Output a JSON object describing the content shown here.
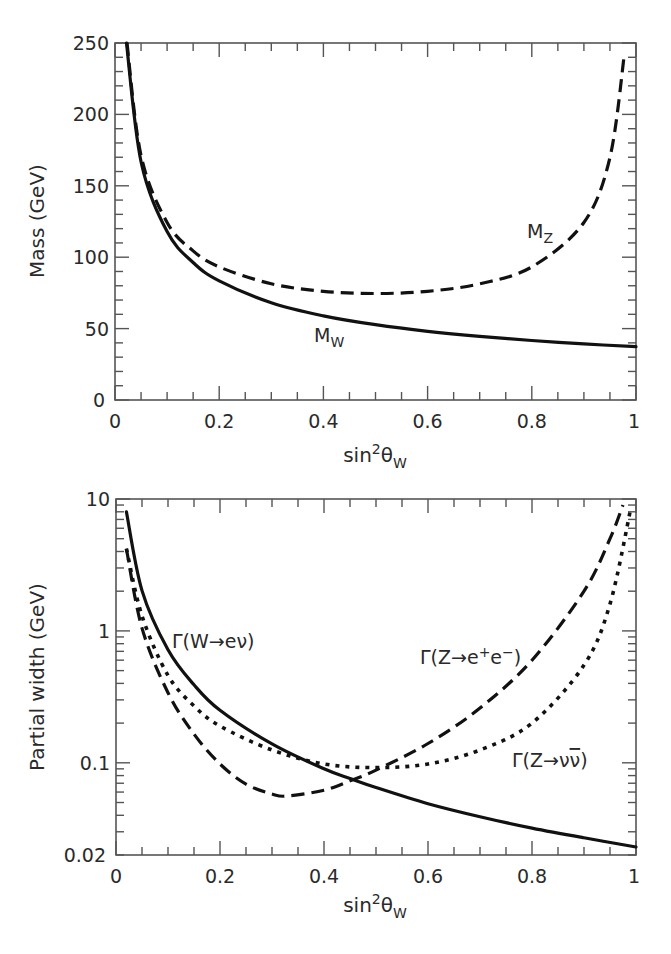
{
  "chart_data": [
    {
      "type": "line",
      "panel": "top",
      "xlabel": "sin²θ_W",
      "xlabel_parts": {
        "base": "sin",
        "sup": "2",
        "theta": "θ",
        "sub": "W"
      },
      "ylabel": "Mass (GeV)",
      "xlim": [
        0,
        1
      ],
      "ylim": [
        0,
        250
      ],
      "x_ticks": [
        "0",
        "0.2",
        "0.4",
        "0.6",
        "0.8",
        "1"
      ],
      "y_ticks": [
        "0",
        "50",
        "100",
        "150",
        "200",
        "250"
      ],
      "grid": false,
      "series": [
        {
          "name": "M_W",
          "label_base": "M",
          "label_sub": "W",
          "style": "solid",
          "x": [
            0.022,
            0.05,
            0.1,
            0.15,
            0.2,
            0.3,
            0.4,
            0.5,
            0.6,
            0.7,
            0.8,
            0.9,
            1.0
          ],
          "y": [
            250,
            166.7,
            117.9,
            96.3,
            83.4,
            68.1,
            58.9,
            52.7,
            48.1,
            44.6,
            41.7,
            39.3,
            37.3
          ]
        },
        {
          "name": "M_Z",
          "label_base": "M",
          "label_sub": "Z",
          "style": "dashed",
          "x": [
            0.023,
            0.05,
            0.1,
            0.15,
            0.2,
            0.3,
            0.4,
            0.5,
            0.6,
            0.7,
            0.8,
            0.9,
            0.95,
            0.978
          ],
          "y": [
            250,
            171,
            124.3,
            104.4,
            93.2,
            81.4,
            76.1,
            74.6,
            76.1,
            81.4,
            93.2,
            124.3,
            170,
            243
          ]
        }
      ]
    },
    {
      "type": "line",
      "panel": "bottom",
      "xlabel": "sin²θ_W",
      "xlabel_parts": {
        "base": "sin",
        "sup": "2",
        "theta": "θ",
        "sub": "W"
      },
      "ylabel": "Partial width (GeV)",
      "yscale": "log",
      "xlim": [
        0,
        1
      ],
      "ylim": [
        0.02,
        10
      ],
      "x_ticks": [
        "0",
        "0.2",
        "0.4",
        "0.6",
        "0.8",
        "1"
      ],
      "y_ticks": [
        "0.02",
        "0.1",
        "1",
        "10"
      ],
      "grid": false,
      "series": [
        {
          "name": "Γ(W→eν)",
          "label": "Γ(W→eν)",
          "style": "solid",
          "x": [
            0.02,
            0.05,
            0.1,
            0.15,
            0.2,
            0.3,
            0.4,
            0.45,
            0.5,
            0.6,
            0.7,
            0.8,
            0.9,
            1.0
          ],
          "y": [
            8.0,
            2.02,
            0.72,
            0.39,
            0.25,
            0.139,
            0.09,
            0.076,
            0.065,
            0.049,
            0.039,
            0.032,
            0.027,
            0.023
          ]
        },
        {
          "name": "Γ(Z→e⁺e⁻)",
          "label": "Γ(Z→e⁺e⁻)",
          "style": "dashed",
          "x": [
            0.02,
            0.05,
            0.1,
            0.15,
            0.2,
            0.25,
            0.3,
            0.33,
            0.4,
            0.45,
            0.5,
            0.6,
            0.7,
            0.8,
            0.9,
            0.95,
            0.975
          ],
          "y": [
            4.2,
            1.05,
            0.34,
            0.165,
            0.098,
            0.069,
            0.058,
            0.056,
            0.062,
            0.073,
            0.088,
            0.14,
            0.26,
            0.6,
            2.0,
            5.0,
            9.0
          ]
        },
        {
          "name": "Γ(Z→νν̄)",
          "label": "Γ(Z→νν̄)",
          "style": "dotted",
          "x": [
            0.02,
            0.05,
            0.1,
            0.15,
            0.2,
            0.3,
            0.4,
            0.5,
            0.6,
            0.7,
            0.8,
            0.9,
            0.95,
            0.99
          ],
          "y": [
            4.2,
            1.3,
            0.46,
            0.27,
            0.19,
            0.125,
            0.098,
            0.092,
            0.098,
            0.125,
            0.2,
            0.55,
            1.6,
            8.5
          ]
        }
      ]
    }
  ],
  "labels": {
    "top_ylabel": "Mass (GeV)",
    "bottom_ylabel": "Partial width (GeV)",
    "xlabel_base": "sin",
    "xlabel_sup": "2",
    "xlabel_theta": "θ",
    "xlabel_sub": "W",
    "mw_base": "M",
    "mw_sub": "W",
    "mz_base": "M",
    "mz_sub": "Z",
    "gamma_w": "Γ(W→eν)",
    "gamma_zee_pre": "Γ(Z→e",
    "gamma_zee_sup1": "+",
    "gamma_zee_mid": "e",
    "gamma_zee_sup2": "−",
    "gamma_zee_post": ")",
    "gamma_znn_pre": "Γ(Z→ν",
    "gamma_znn_bar": "ν",
    "gamma_znn_post": ")"
  },
  "ticks": {
    "top_x": [
      "0",
      "0.2",
      "0.4",
      "0.6",
      "0.8",
      "1"
    ],
    "top_y": [
      "0",
      "50",
      "100",
      "150",
      "200",
      "250"
    ],
    "bottom_x": [
      "0",
      "0.2",
      "0.4",
      "0.6",
      "0.8",
      "1"
    ],
    "bottom_y": [
      "0.02",
      "0.1",
      "1",
      "10"
    ]
  }
}
